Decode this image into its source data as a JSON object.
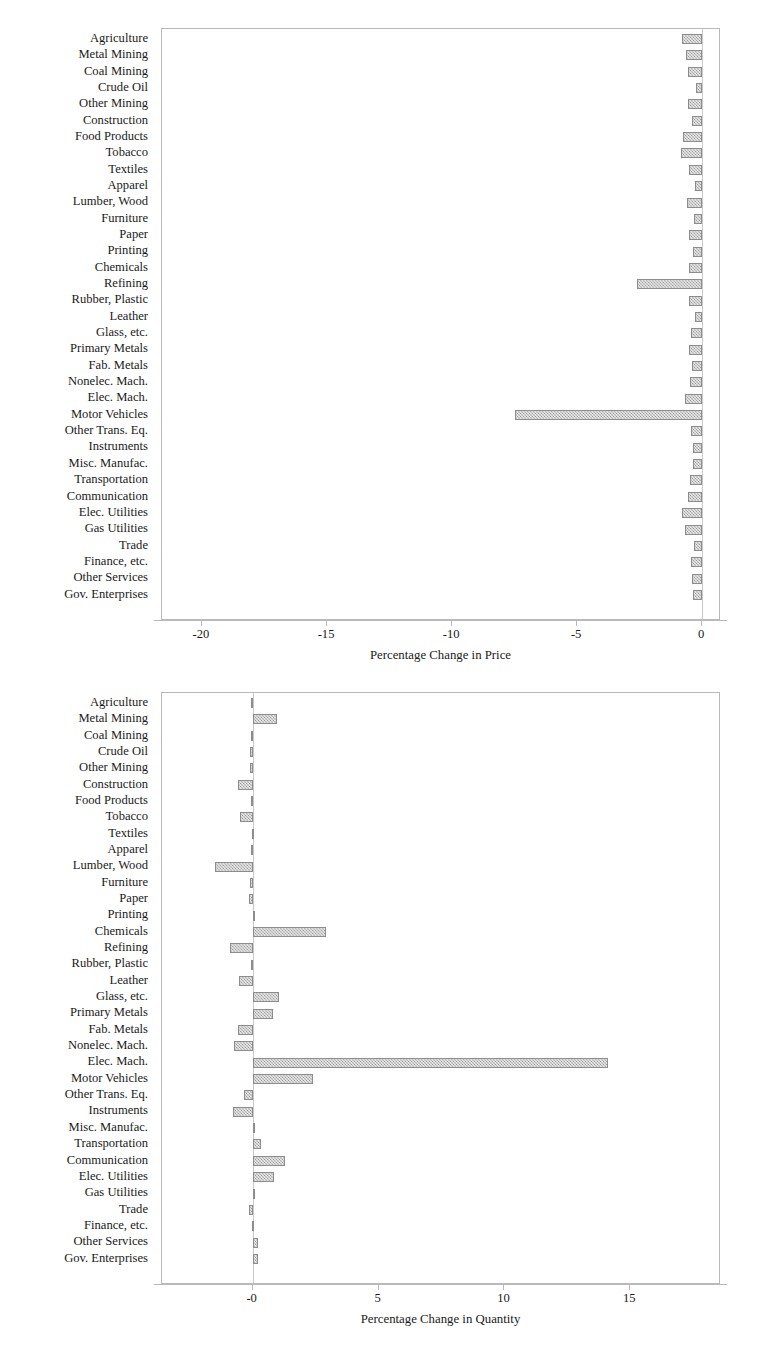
{
  "categories": [
    "Agriculture",
    "Metal Mining",
    "Coal Mining",
    "Crude Oil",
    "Other Mining",
    "Construction",
    "Food Products",
    "Tobacco",
    "Textiles",
    "Apparel",
    "Lumber, Wood",
    "Furniture",
    "Paper",
    "Printing",
    "Chemicals",
    "Refining",
    "Rubber, Plastic",
    "Leather",
    "Glass, etc.",
    "Primary Metals",
    "Fab. Metals",
    "Nonelec. Mach.",
    "Elec. Mach.",
    "Motor Vehicles",
    "Other Trans. Eq.",
    "Instruments",
    "Misc. Manufac.",
    "Transportation",
    "Communication",
    "Elec. Utilities",
    "Gas Utilities",
    "Trade",
    "Finance, etc.",
    "Other Services",
    "Gov. Enterprises"
  ],
  "colors": {
    "bar_fill": "#9a9a9a",
    "bar_edge": "#8d8d8d",
    "axis": "#b9b9b9",
    "text": "#1a1a1a",
    "background": "#ffffff"
  },
  "chart_data": [
    {
      "id": "price",
      "type": "bar",
      "orientation": "horizontal",
      "title": "",
      "xlabel": "Percentage Change in Price",
      "ylabel": "",
      "xlim": [
        -21.6,
        0.75
      ],
      "xticks": [
        -20,
        -15,
        -10,
        -5,
        0
      ],
      "xticklabels": [
        "-20",
        "-15",
        "-10",
        "-5",
        "0"
      ],
      "grid": false,
      "legend": null,
      "categories": [
        "Agriculture",
        "Metal Mining",
        "Coal Mining",
        "Crude Oil",
        "Other Mining",
        "Construction",
        "Food Products",
        "Tobacco",
        "Textiles",
        "Apparel",
        "Lumber, Wood",
        "Furniture",
        "Paper",
        "Printing",
        "Chemicals",
        "Refining",
        "Rubber, Plastic",
        "Leather",
        "Glass, etc.",
        "Primary Metals",
        "Fab. Metals",
        "Nonelec. Mach.",
        "Elec. Mach.",
        "Motor Vehicles",
        "Other Trans. Eq.",
        "Instruments",
        "Misc. Manufac.",
        "Transportation",
        "Communication",
        "Elec. Utilities",
        "Gas Utilities",
        "Trade",
        "Finance, etc.",
        "Other Services",
        "Gov. Enterprises"
      ],
      "values": [
        -0.81,
        -0.63,
        -0.56,
        -0.26,
        -0.55,
        -0.41,
        -0.75,
        -0.85,
        -0.54,
        -0.27,
        -0.6,
        -0.33,
        -0.53,
        -0.36,
        -0.54,
        -2.6,
        -0.52,
        -0.3,
        -0.45,
        -0.54,
        -0.42,
        -0.5,
        -0.68,
        -7.5,
        -0.45,
        -0.37,
        -0.36,
        -0.5,
        -0.55,
        -0.8,
        -0.7,
        -0.34,
        -0.44,
        -0.4,
        -0.36
      ]
    },
    {
      "id": "quantity",
      "type": "bar",
      "orientation": "horizontal",
      "title": "",
      "xlabel": "Percentage Change in Quantity",
      "ylabel": "",
      "xlim": [
        -3.6,
        18.6
      ],
      "xticks": [
        0,
        5,
        10,
        15
      ],
      "xticklabels": [
        "-0",
        "5",
        "10",
        "15"
      ],
      "grid": false,
      "legend": null,
      "categories": [
        "Agriculture",
        "Metal Mining",
        "Coal Mining",
        "Crude Oil",
        "Other Mining",
        "Construction",
        "Food Products",
        "Tobacco",
        "Textiles",
        "Apparel",
        "Lumber, Wood",
        "Furniture",
        "Paper",
        "Printing",
        "Chemicals",
        "Refining",
        "Rubber, Plastic",
        "Leather",
        "Glass, etc.",
        "Primary Metals",
        "Fab. Metals",
        "Nonelec. Mach.",
        "Elec. Mach.",
        "Motor Vehicles",
        "Other Trans. Eq.",
        "Instruments",
        "Misc. Manufac.",
        "Transportation",
        "Communication",
        "Elec. Utilities",
        "Gas Utilities",
        "Trade",
        "Finance, etc.",
        "Other Services",
        "Gov. Enterprises"
      ],
      "values": [
        -0.08,
        0.95,
        -0.06,
        -0.12,
        -0.1,
        -0.6,
        -0.07,
        -0.5,
        -0.04,
        -0.05,
        -1.5,
        -0.09,
        -0.14,
        0.1,
        2.9,
        -0.9,
        -0.06,
        -0.55,
        1.05,
        0.8,
        -0.6,
        -0.75,
        14.1,
        2.4,
        -0.35,
        -0.8,
        0.05,
        0.35,
        1.3,
        0.85,
        0.02,
        -0.15,
        -0.03,
        0.2,
        0.2
      ]
    }
  ]
}
